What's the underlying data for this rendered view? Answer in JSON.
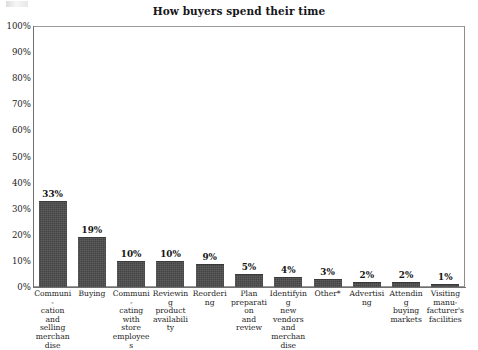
{
  "chart_data": {
    "type": "bar",
    "title": "How buyers spend their time",
    "xlabel": "",
    "ylabel": "",
    "ylim": [
      0,
      100
    ],
    "ytick_labels": [
      "100%",
      "90%",
      "80%",
      "70%",
      "60%",
      "50%",
      "40%",
      "30%",
      "20%",
      "10%",
      "0%"
    ],
    "ytick_values": [
      100,
      90,
      80,
      70,
      60,
      50,
      40,
      30,
      20,
      10,
      0
    ],
    "grid": false,
    "legend": null,
    "bar_color": "#4b4b4b",
    "categories": [
      "Communi-\ncation and\nselling\nmerchandise",
      "Buying",
      "Communi-\ncating with\nstore\nemployees",
      "Reviewing\nproduct\navailability",
      "Reordering",
      "Plan\npreparation\nand review",
      "Identifying\nnew\nvendors\nand\nmerchandise",
      "Other*",
      "Advertising",
      "Attending\nbuying\nmarkets",
      "Visiting\nmanu-\nfacturer's\nfacilities"
    ],
    "values": [
      33,
      19,
      10,
      10,
      9,
      5,
      4,
      3,
      2,
      2,
      1
    ],
    "value_labels": [
      "33%",
      "19%",
      "10%",
      "10%",
      "9%",
      "5%",
      "4%",
      "3%",
      "2%",
      "2%",
      "1%"
    ]
  }
}
